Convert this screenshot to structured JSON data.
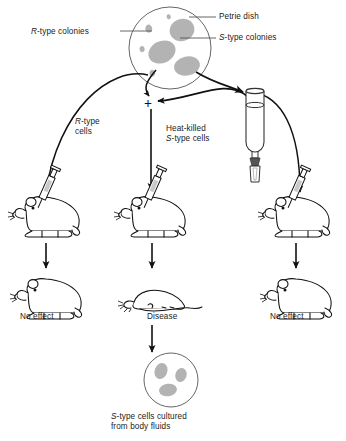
{
  "figure": {
    "labels": {
      "r_colonies": "R-type colonies",
      "petrie_dish": "Petrie dish",
      "s_colonies": "S-type colonies",
      "r_cells": "R-type\ncells",
      "heat_killed_s_cells": "Heat-killed\nS-type cells",
      "plus": "+",
      "no_effect_left": "No effect",
      "disease": "Disease",
      "no_effect_right": "No effect",
      "cultured": "S-type cells cultured\nfrom body fluids"
    },
    "label_parts": {
      "r_colonies_italic": "R",
      "r_colonies_rest": "-type colonies",
      "s_colonies_italic": "S",
      "s_colonies_rest": "-type colonies",
      "r_cells_italic": "R",
      "r_cells_rest": "-type",
      "r_cells_line2": "cells",
      "hk_line1": "Heat-killed",
      "hk_italic": "S",
      "hk_rest": "-type cells",
      "cultured_italic": "S",
      "cultured_rest": "-type cells cultured",
      "cultured_line2": "from body fluids"
    },
    "objects": {
      "petrie_dish_name": "petrie-dish",
      "test_tube_name": "test-tube",
      "syringe_name": "syringe",
      "mouse_live_name": "live-mouse",
      "mouse_dead_name": "dead-mouse",
      "culture_dish_name": "culture-dish"
    },
    "colors": {
      "stroke": "#1a1a1a",
      "colony_fill": "#b0b0b0",
      "dish_outline": "#555555",
      "leader_line": "#555555",
      "background": "#ffffff"
    },
    "counts": {
      "r_colonies_in_dish": 4,
      "s_colonies_in_dish": 3,
      "mice_rows": 2,
      "mice_per_row": 3,
      "cultured_colonies": 3
    }
  }
}
